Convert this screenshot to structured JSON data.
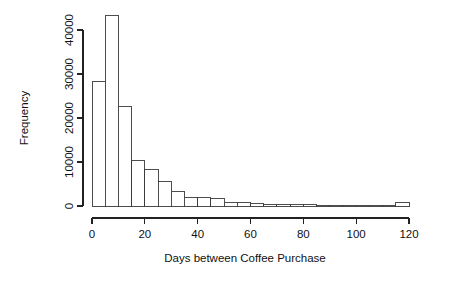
{
  "chart_data": {
    "type": "bar",
    "title": "",
    "subtitle": "",
    "xlabel": "Days between Coffee Purchase",
    "ylabel": "Frequency",
    "xlim": [
      0,
      120
    ],
    "ylim": [
      0,
      44000
    ],
    "grid": false,
    "legend": null,
    "bin_width": 5,
    "x_ticks": [
      0,
      20,
      40,
      60,
      80,
      100,
      120
    ],
    "x_tick_labels": [
      "0",
      "20",
      "40",
      "60",
      "80",
      "100",
      "120"
    ],
    "y_ticks": [
      0,
      10000,
      20000,
      30000,
      40000
    ],
    "y_tick_labels": [
      "0",
      "10000",
      "20000",
      "30000",
      "40000"
    ],
    "bin_starts": [
      0,
      5,
      10,
      15,
      20,
      25,
      30,
      35,
      40,
      45,
      50,
      55,
      60,
      65,
      70,
      75,
      80,
      85,
      90,
      95,
      100,
      105,
      110,
      115
    ],
    "bin_ends": [
      5,
      10,
      15,
      20,
      25,
      30,
      35,
      40,
      45,
      50,
      55,
      60,
      65,
      70,
      75,
      80,
      85,
      90,
      95,
      100,
      105,
      110,
      115,
      120
    ],
    "categories": [
      "0-5",
      "5-10",
      "10-15",
      "15-20",
      "20-25",
      "25-30",
      "30-35",
      "35-40",
      "40-45",
      "45-50",
      "50-55",
      "55-60",
      "60-65",
      "65-70",
      "70-75",
      "75-80",
      "80-85",
      "85-90",
      "90-95",
      "95-100",
      "100-105",
      "105-110",
      "110-115",
      "115-120"
    ],
    "values": [
      28400,
      43200,
      22700,
      10400,
      8400,
      5500,
      3400,
      2000,
      1900,
      1700,
      800,
      750,
      600,
      300,
      300,
      300,
      250,
      150,
      150,
      100,
      100,
      100,
      100,
      900
    ],
    "colors": {
      "bar_fill": "#ffffff",
      "bar_stroke": "#3a3a3a",
      "axis": "#222222",
      "text": "#111111",
      "background": "#ffffff"
    }
  }
}
